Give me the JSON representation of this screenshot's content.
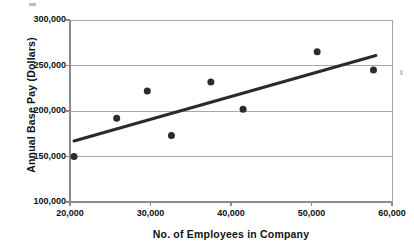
{
  "chart_data": {
    "type": "scatter",
    "title": "",
    "xlabel": "No. of Employees in Company",
    "ylabel": "Annual Base Pay (Dollars)",
    "xlim": [
      20000,
      60000
    ],
    "ylim": [
      100000,
      300000
    ],
    "grid": true,
    "legend": "none",
    "x_ticks": [
      20000,
      30000,
      40000,
      50000,
      60000
    ],
    "x_tick_labels": [
      "20,000",
      "30,000",
      "40,000",
      "50,000",
      "60,000"
    ],
    "y_ticks": [
      100000,
      150000,
      200000,
      250000,
      300000
    ],
    "y_tick_labels": [
      "100,000",
      "150,000",
      "200,000",
      "250,000",
      "300,000"
    ],
    "marker": {
      "shape": "circle",
      "color": "#2b2b2b",
      "size_px": 7
    },
    "points": [
      {
        "x": 20500,
        "y": 150000
      },
      {
        "x": 25800,
        "y": 192000
      },
      {
        "x": 29600,
        "y": 222000
      },
      {
        "x": 32600,
        "y": 173000
      },
      {
        "x": 37500,
        "y": 232000
      },
      {
        "x": 41500,
        "y": 202000
      },
      {
        "x": 50700,
        "y": 265000
      },
      {
        "x": 57700,
        "y": 245000
      }
    ],
    "series": [
      {
        "name": "Companies",
        "x": [
          20500,
          25800,
          29600,
          32600,
          37500,
          41500,
          50700,
          57700
        ],
        "values": [
          150000,
          192000,
          222000,
          173000,
          232000,
          202000,
          265000,
          245000
        ]
      }
    ],
    "trendline": {
      "type": "linear",
      "color": "#2b2b2b",
      "width_px": 3,
      "x_start": 20500,
      "y_start": 167000,
      "x_end": 58000,
      "y_end": 261000
    },
    "style": {
      "gridline_color": "#a6a6a6",
      "axis_color": "#8c8c8c",
      "background": "#ffffff"
    }
  },
  "axes": {
    "y_title": "Annual Base Pay (Dollars)",
    "x_title": "No. of Employees in Company"
  }
}
